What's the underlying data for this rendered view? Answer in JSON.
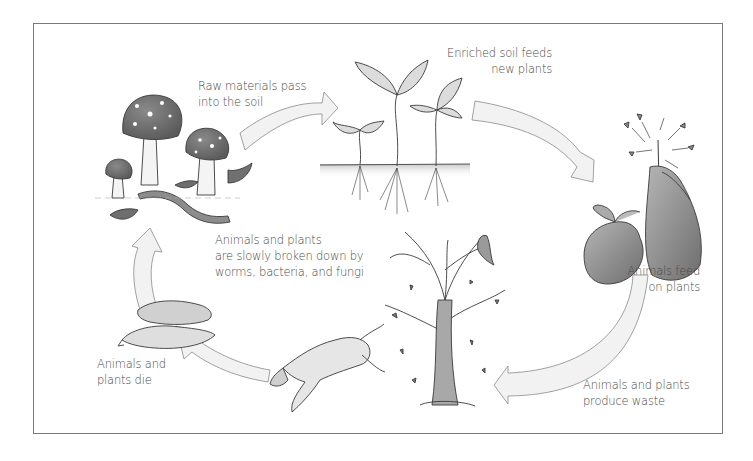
{
  "diagram": {
    "type": "cycle",
    "stages": [
      {
        "id": "decompose",
        "illustration": "mushrooms-worm-leaves",
        "caption_lines": [
          "Animals and plants",
          "are slowly broken down by",
          "worms, bacteria, and fungi"
        ]
      },
      {
        "id": "raw-materials",
        "illustration": "arrow",
        "caption_lines": [
          "Raw materials pass",
          "into the soil"
        ]
      },
      {
        "id": "new-plants",
        "illustration": "seedlings-in-soil",
        "caption_lines": [
          "Enriched soil feeds",
          "new plants"
        ]
      },
      {
        "id": "animals-feed",
        "illustration": "rabbits-eating-plant",
        "caption_lines": [
          "Animals feed",
          "on plants"
        ]
      },
      {
        "id": "waste",
        "illustration": "tree-dropping-leaves-with-bird",
        "caption_lines": [
          "Animals and plants",
          "produce waste"
        ]
      },
      {
        "id": "die",
        "illustration": "dead-bird-and-fox",
        "caption_lines": [
          "Animals and",
          "plants die"
        ]
      }
    ],
    "flow": [
      "decompose",
      "raw-materials",
      "new-plants",
      "animals-feed",
      "waste",
      "die",
      "decompose"
    ],
    "colors": {
      "frame": "#7a7a7a",
      "text": "#4a4a4a",
      "arrow_fill": "#f1f1f1",
      "arrow_stroke": "#8a8a8a",
      "ink": "#3a3a3a",
      "shade": "#8c8c8c"
    }
  }
}
